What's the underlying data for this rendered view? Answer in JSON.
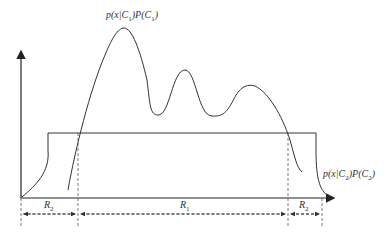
{
  "diagram": {
    "type": "decision-regions",
    "curves": [
      {
        "id": "c1",
        "label": "p(x|C1)P(C1)",
        "label_parts": {
          "pre": "p(x|C",
          "sub1": "1",
          "mid": ")P(C",
          "sub2": "1",
          "post": ")"
        }
      },
      {
        "id": "c2",
        "label": "p(x|C2)P(C2)",
        "label_parts": {
          "pre": "p(x|C",
          "sub1": "2",
          "mid": ")P(C",
          "sub2": "2",
          "post": ")"
        }
      }
    ],
    "regions": [
      {
        "name": "R",
        "sub": "2"
      },
      {
        "name": "R",
        "sub": "1"
      },
      {
        "name": "R",
        "sub": "2"
      }
    ],
    "colors": {
      "line": "#333333",
      "dashed": "#555555",
      "background": "#ffffff"
    }
  }
}
